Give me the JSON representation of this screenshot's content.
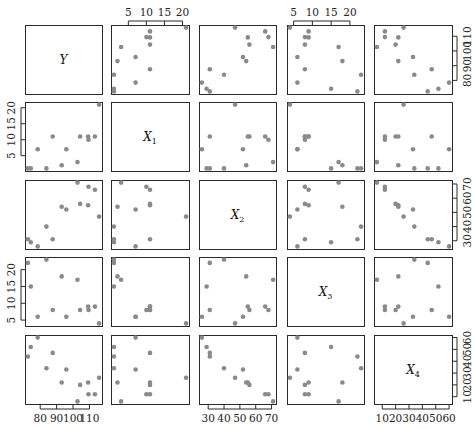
{
  "chart_data": {
    "type": "scatter",
    "subtype": "scatterplot-matrix",
    "title": "",
    "variables": [
      {
        "name": "Y",
        "label": "Y",
        "sub": ""
      },
      {
        "name": "X1",
        "label": "X",
        "sub": "1"
      },
      {
        "name": "X2",
        "label": "X",
        "sub": "2"
      },
      {
        "name": "X3",
        "label": "X",
        "sub": "3"
      },
      {
        "name": "X4",
        "label": "X",
        "sub": "4"
      }
    ],
    "data": {
      "Y": [
        78.5,
        74.3,
        104.3,
        87.6,
        95.9,
        109.2,
        102.7,
        72.5,
        93.1,
        115.9,
        83.8,
        113.3,
        109.4
      ],
      "X1": [
        7,
        1,
        11,
        11,
        7,
        11,
        3,
        1,
        2,
        21,
        1,
        11,
        10
      ],
      "X2": [
        26,
        29,
        56,
        31,
        52,
        55,
        71,
        31,
        54,
        47,
        40,
        66,
        68
      ],
      "X3": [
        6,
        15,
        8,
        8,
        6,
        9,
        17,
        22,
        18,
        4,
        23,
        9,
        8
      ],
      "X4": [
        60,
        52,
        20,
        47,
        33,
        22,
        6,
        44,
        22,
        26,
        34,
        12,
        12
      ]
    },
    "axis_ranges": {
      "Y": [
        72.5,
        115.9
      ],
      "X1": [
        1,
        21
      ],
      "X2": [
        26,
        71
      ],
      "X3": [
        4,
        23
      ],
      "X4": [
        6,
        60
      ]
    },
    "ticks": {
      "Y": {
        "values": [
          80,
          90,
          100,
          110
        ],
        "labels": [
          "80",
          "90",
          "100",
          "110"
        ],
        "side": "bottom-col0 / right-row0"
      },
      "X1": {
        "values": [
          5,
          10,
          15,
          20
        ],
        "labels": [
          "5",
          "10",
          "15",
          "20"
        ],
        "side": "top-col1 / left-row1"
      },
      "X2": {
        "values": [
          30,
          40,
          50,
          60,
          70
        ],
        "labels": [
          "30",
          "40",
          "50",
          "60",
          "70"
        ],
        "side": "bottom-col2 / right-row2"
      },
      "X3": {
        "values": [
          5,
          10,
          15,
          20
        ],
        "labels": [
          "5",
          "10",
          "15",
          "20"
        ],
        "side": "top-col3 / left-row3"
      },
      "X4": {
        "values": [
          10,
          20,
          30,
          40,
          50,
          60
        ],
        "labels": [
          "10",
          "20",
          "30",
          "40",
          "50",
          "60"
        ],
        "side": "bottom-col4 / right-row4"
      }
    },
    "grid": false,
    "legend": null,
    "point_color": "#8a8a8a",
    "frame_color": "#2b2b2b",
    "xlabel": "",
    "ylabel": ""
  },
  "layout": {
    "cols": [
      [
        25,
        102
      ],
      [
        111,
        189
      ],
      [
        199,
        276
      ],
      [
        287,
        364
      ],
      [
        374,
        452
      ]
    ],
    "rows": [
      [
        25,
        94
      ],
      [
        102,
        171
      ],
      [
        180,
        249
      ],
      [
        257,
        326
      ],
      [
        335,
        404
      ]
    ]
  }
}
